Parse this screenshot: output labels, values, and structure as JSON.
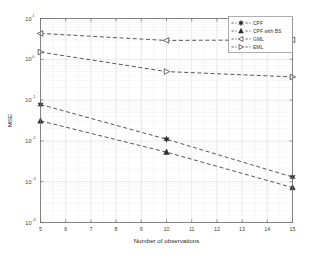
{
  "chart_data": {
    "type": "line",
    "title": "",
    "xlabel": "Number of observations",
    "ylabel": "MSE",
    "xlim": [
      5,
      15
    ],
    "ylim": [
      0.0001,
      10
    ],
    "yscale": "log",
    "xscale": "linear",
    "grid": true,
    "grid_minor": true,
    "legend_position": "top-right",
    "x": [
      5,
      10,
      15
    ],
    "xticks": [
      5,
      6,
      7,
      8,
      9,
      10,
      11,
      12,
      13,
      14,
      15
    ],
    "xtick_labels": [
      "5",
      "6",
      "7",
      "8",
      "9",
      "10",
      "11",
      "12",
      "13",
      "14",
      "15"
    ],
    "yticks": [
      0.0001,
      0.001,
      0.01,
      0.1,
      1,
      10
    ],
    "ytick_labels": [
      "10-4",
      "10-3",
      "10-2",
      "10-1",
      "100",
      "101"
    ],
    "ytick_mantissa": [
      "10",
      "10",
      "10",
      "10",
      "10",
      "10"
    ],
    "ytick_exponents": [
      "-4",
      "-3",
      "-2",
      "-1",
      "0",
      "1"
    ],
    "series": [
      {
        "name": "CPF",
        "marker": "hexagram-icon",
        "linestyle": "dashed",
        "color": "#3a3a3a",
        "values": [
          0.078,
          0.011,
          0.0013
        ]
      },
      {
        "name": "CPF with BS",
        "marker": "triangle-up-icon",
        "linestyle": "dashed",
        "color": "#3a3a3a",
        "values": [
          0.031,
          0.0053,
          0.00072
        ]
      },
      {
        "name": "GML",
        "marker": "triangle-left-icon",
        "linestyle": "dashed",
        "color": "#3a3a3a",
        "values": [
          4.3,
          2.9,
          3.0
        ]
      },
      {
        "name": "EML",
        "marker": "triangle-right-icon",
        "linestyle": "dashed",
        "color": "#3a3a3a",
        "values": [
          1.5,
          0.5,
          0.37
        ]
      }
    ]
  },
  "legend": {
    "entries": [
      {
        "label": "CPF",
        "marker": "hexagram-icon"
      },
      {
        "label": "CPF with BS",
        "marker": "triangle-up-icon"
      },
      {
        "label": "GML",
        "marker": "triangle-left-icon"
      },
      {
        "label": "EML",
        "marker": "triangle-right-icon"
      }
    ]
  },
  "colors": {
    "line": "#3a3a3a",
    "marker": "#2b2b2b",
    "axis": "#6b6b6b",
    "grid_major": "#d8d8d8",
    "grid_minor": "#ececec",
    "background": "#ffffff",
    "text": "#3a3a3a"
  }
}
